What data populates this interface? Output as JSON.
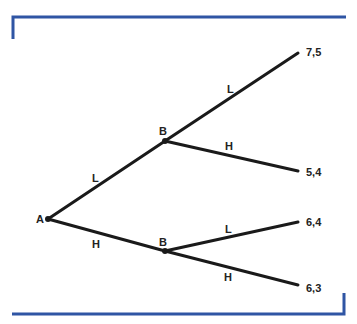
{
  "diagram": {
    "type": "game-tree",
    "colors": {
      "frame": "#2f55a4",
      "edge": "#1a1a1a",
      "text": "#222222"
    },
    "nodes": {
      "root": {
        "label": "A"
      },
      "upper": {
        "label": "B"
      },
      "lower": {
        "label": "B"
      }
    },
    "edges": {
      "root_upper": {
        "label": "L"
      },
      "root_lower": {
        "label": "H"
      },
      "upper_top": {
        "label": "L"
      },
      "upper_bottom": {
        "label": "H"
      },
      "lower_top": {
        "label": "L"
      },
      "lower_bottom": {
        "label": "H"
      }
    },
    "payoffs": {
      "p1": "7,5",
      "p2": "5,4",
      "p3": "6,4",
      "p4": "6,3"
    }
  }
}
